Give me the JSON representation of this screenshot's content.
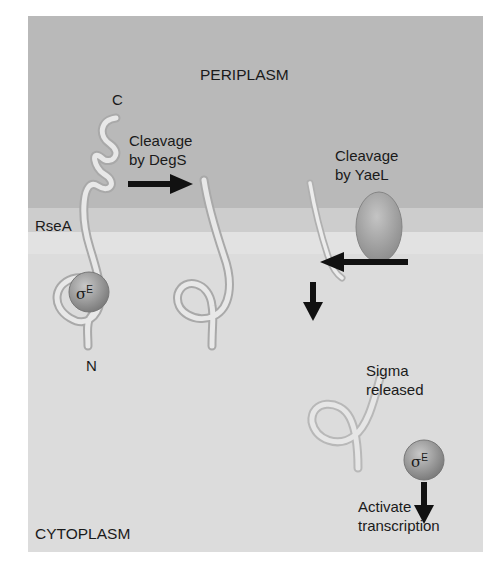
{
  "diagram": {
    "regions": {
      "periplasm": "PERIPLASM",
      "cytoplasm": "CYTOPLASM"
    },
    "labels": {
      "c_terminus": "C",
      "n_terminus": "N",
      "rsea": "RseA",
      "step1_line1": "Cleavage",
      "step1_line2": "by DegS",
      "step2_line1": "Cleavage",
      "step2_line2": "by YaeL",
      "step3_line1": "Sigma",
      "step3_line2": "released",
      "step4_line1": "Activate",
      "step4_line2": "transcription",
      "sigma_symbol": "σ",
      "sigma_superscript": "E"
    },
    "colors": {
      "periplasm": "#b9b9b9",
      "membrane": "#cdcdcd",
      "cytoplasm": "#dcdcdc",
      "protein_strand": "#e6e6e6",
      "sigma_sphere": "#8f8f8f",
      "yael_ellipse": "#9a9a9a",
      "arrow": "#111111"
    }
  }
}
